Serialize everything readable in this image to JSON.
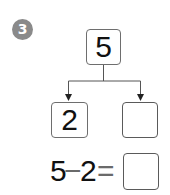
{
  "problem": {
    "number": "3",
    "badge_color": "#8a8a8a"
  },
  "tree": {
    "whole": "5",
    "part_left": "2",
    "part_right": ""
  },
  "equation": {
    "operand1": "5",
    "operator": "−",
    "operand2": "2",
    "equals": "=",
    "answer": ""
  }
}
